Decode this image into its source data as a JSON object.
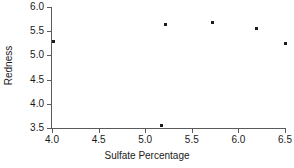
{
  "chart_data": {
    "type": "scatter",
    "title": "",
    "xlabel": "Sulfate Percentage",
    "ylabel": "Redness",
    "xlim": [
      4.0,
      6.5
    ],
    "ylim": [
      3.5,
      6.0
    ],
    "xticks": [
      "4.0",
      "4.5",
      "5.0",
      "5.5",
      "6.0",
      "6.5"
    ],
    "yticks": [
      "6.0",
      "5.5",
      "5.0",
      "4.5",
      "4.0",
      "3.5"
    ],
    "grid": false,
    "legend": false,
    "marker": "square",
    "marker_color": "#1c1c1c",
    "axis_color": "#5a5a5a",
    "points": [
      {
        "x": 4.02,
        "y": 5.29
      },
      {
        "x": 5.18,
        "y": 3.56
      },
      {
        "x": 5.22,
        "y": 5.63
      },
      {
        "x": 5.72,
        "y": 5.68
      },
      {
        "x": 6.19,
        "y": 5.55
      },
      {
        "x": 6.5,
        "y": 5.25
      }
    ]
  }
}
